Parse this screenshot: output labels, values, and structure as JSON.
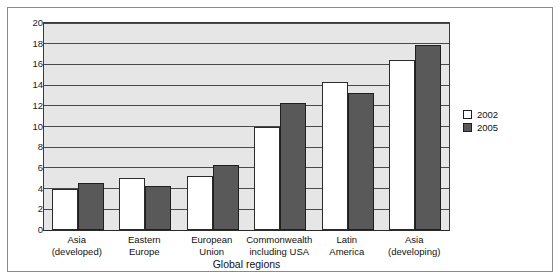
{
  "chart_data": {
    "type": "bar",
    "title": "",
    "xlabel": "Global regions",
    "ylabel": "",
    "ylim": [
      0,
      20
    ],
    "yticks": [
      0,
      2,
      4,
      6,
      8,
      10,
      12,
      14,
      16,
      18,
      20
    ],
    "ytick_labels": [
      "0",
      "2",
      "4",
      "6",
      "8",
      "10",
      "12",
      "14",
      "16",
      "18",
      "20"
    ],
    "grid": true,
    "legend_position": "right",
    "categories": [
      "Asia\n(developed)",
      "Eastern\nEurope",
      "European\nUnion",
      "Commonwealth\nincluding USA",
      "Latin\nAmerica",
      "Asia\n(developing)"
    ],
    "category_lines": [
      [
        "Asia",
        "(developed)"
      ],
      [
        "Eastern",
        "Europe"
      ],
      [
        "European",
        "Union"
      ],
      [
        "Commonwealth",
        "including USA"
      ],
      [
        "Latin",
        "America"
      ],
      [
        "Asia",
        "(developing)"
      ]
    ],
    "series": [
      {
        "name": "2002",
        "color": "#ffffff",
        "values": [
          4.0,
          5.0,
          5.2,
          10.0,
          14.3,
          16.4
        ]
      },
      {
        "name": "2005",
        "color": "#595959",
        "values": [
          4.5,
          4.3,
          6.3,
          12.3,
          13.2,
          17.9
        ]
      }
    ]
  },
  "legend": {
    "items": [
      {
        "label": "2002",
        "swatch": "white-square-icon"
      },
      {
        "label": "2005",
        "swatch": "dark-square-icon"
      }
    ]
  },
  "axis": {
    "x_title": "Global regions"
  }
}
